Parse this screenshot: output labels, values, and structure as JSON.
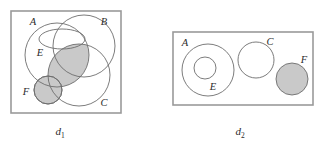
{
  "figure": {
    "title": "",
    "background_color": "#ffffff",
    "frame_color": "#9a9a9a",
    "curve_color": "#6d6d6d",
    "shade_color": "#c9c9c9"
  },
  "panels": [
    {
      "id": "d1",
      "caption_base": "d",
      "caption_sub": "1",
      "frame": {
        "x": 11,
        "y": 11,
        "width": 110,
        "height": 102
      },
      "shapes": [
        {
          "name": "circle-A",
          "label": "A",
          "type": "circle",
          "shaded": false
        },
        {
          "name": "circle-B",
          "label": "B",
          "type": "circle",
          "shaded": false
        },
        {
          "name": "circle-C",
          "label": "C",
          "type": "circle",
          "shaded": false
        },
        {
          "name": "ellipse-E",
          "label": "E",
          "type": "ellipse",
          "shaded": false
        },
        {
          "name": "circle-F",
          "label": "F",
          "type": "circle",
          "shaded": true
        }
      ],
      "shaded_regions": [
        "A-intersect-C lens",
        "F circle"
      ],
      "labels": [
        {
          "text": "A",
          "x": 33,
          "y": 24
        },
        {
          "text": "B",
          "x": 104,
          "y": 24
        },
        {
          "text": "E",
          "x": 40,
          "y": 53
        },
        {
          "text": "C",
          "x": 104,
          "y": 104
        },
        {
          "text": "F",
          "x": 26,
          "y": 94
        }
      ]
    },
    {
      "id": "d2",
      "caption_base": "d",
      "caption_sub": "2",
      "frame": {
        "x": 173,
        "y": 32,
        "width": 140,
        "height": 73
      },
      "shapes": [
        {
          "name": "circle-A",
          "label": "A",
          "type": "circle",
          "shaded": false
        },
        {
          "name": "circle-E",
          "label": "E",
          "type": "circle",
          "shaded": false
        },
        {
          "name": "circle-C",
          "label": "C",
          "type": "circle",
          "shaded": false
        },
        {
          "name": "circle-F",
          "label": "F",
          "type": "circle",
          "shaded": true
        }
      ],
      "shaded_regions": [
        "F circle"
      ],
      "labels": [
        {
          "text": "A",
          "x": 185,
          "y": 45
        },
        {
          "text": "E",
          "x": 212,
          "y": 88
        },
        {
          "text": "C",
          "x": 270,
          "y": 44
        },
        {
          "text": "F",
          "x": 303,
          "y": 62
        }
      ]
    }
  ]
}
